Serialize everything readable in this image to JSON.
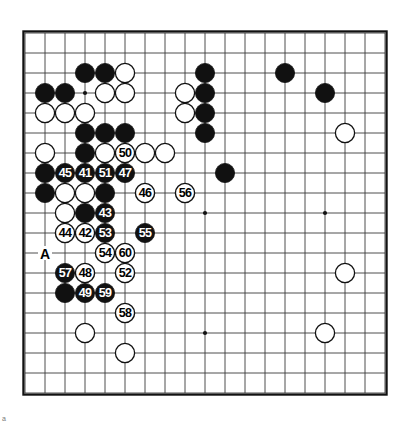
{
  "diagram": {
    "kind": "go-board-diagram",
    "size": 19,
    "origin_x": 25,
    "origin_y": 33,
    "spacing": 20,
    "stone_radius": 9.6,
    "colors": {
      "line": "#3a3a3a",
      "border": "#111111",
      "black_stone": "#111111",
      "white_stone": "#ffffff",
      "background": "#ffffff"
    },
    "star_points": [
      {
        "c": 3,
        "r": 3
      },
      {
        "c": 9,
        "r": 3
      },
      {
        "c": 15,
        "r": 3
      },
      {
        "c": 3,
        "r": 9
      },
      {
        "c": 9,
        "r": 9
      },
      {
        "c": 15,
        "r": 9
      },
      {
        "c": 3,
        "r": 15
      },
      {
        "c": 9,
        "r": 15
      },
      {
        "c": 15,
        "r": 15
      }
    ],
    "plain_stones": [
      {
        "c": 3,
        "r": 2,
        "color": "black"
      },
      {
        "c": 4,
        "r": 2,
        "color": "black"
      },
      {
        "c": 5,
        "r": 2,
        "color": "white"
      },
      {
        "c": 9,
        "r": 2,
        "color": "black"
      },
      {
        "c": 13,
        "r": 2,
        "color": "black"
      },
      {
        "c": 1,
        "r": 3,
        "color": "black"
      },
      {
        "c": 2,
        "r": 3,
        "color": "black"
      },
      {
        "c": 4,
        "r": 3,
        "color": "white"
      },
      {
        "c": 5,
        "r": 3,
        "color": "white"
      },
      {
        "c": 8,
        "r": 3,
        "color": "white"
      },
      {
        "c": 9,
        "r": 3,
        "color": "black"
      },
      {
        "c": 15,
        "r": 3,
        "color": "black"
      },
      {
        "c": 1,
        "r": 4,
        "color": "white"
      },
      {
        "c": 2,
        "r": 4,
        "color": "white"
      },
      {
        "c": 3,
        "r": 4,
        "color": "white"
      },
      {
        "c": 8,
        "r": 4,
        "color": "white"
      },
      {
        "c": 9,
        "r": 4,
        "color": "black"
      },
      {
        "c": 3,
        "r": 5,
        "color": "black"
      },
      {
        "c": 4,
        "r": 5,
        "color": "black"
      },
      {
        "c": 5,
        "r": 5,
        "color": "black"
      },
      {
        "c": 9,
        "r": 5,
        "color": "black"
      },
      {
        "c": 16,
        "r": 5,
        "color": "white"
      },
      {
        "c": 1,
        "r": 6,
        "color": "white"
      },
      {
        "c": 3,
        "r": 6,
        "color": "black"
      },
      {
        "c": 4,
        "r": 6,
        "color": "white"
      },
      {
        "c": 6,
        "r": 6,
        "color": "white"
      },
      {
        "c": 7,
        "r": 6,
        "color": "white"
      },
      {
        "c": 1,
        "r": 7,
        "color": "black"
      },
      {
        "c": 10,
        "r": 7,
        "color": "black"
      },
      {
        "c": 1,
        "r": 8,
        "color": "black"
      },
      {
        "c": 2,
        "r": 8,
        "color": "white"
      },
      {
        "c": 3,
        "r": 8,
        "color": "white"
      },
      {
        "c": 4,
        "r": 8,
        "color": "black"
      },
      {
        "c": 2,
        "r": 9,
        "color": "white"
      },
      {
        "c": 3,
        "r": 9,
        "color": "black"
      },
      {
        "c": 2,
        "r": 13,
        "color": "black"
      },
      {
        "c": 16,
        "r": 12,
        "color": "white"
      },
      {
        "c": 3,
        "r": 15,
        "color": "white"
      },
      {
        "c": 15,
        "r": 15,
        "color": "white"
      },
      {
        "c": 5,
        "r": 16,
        "color": "white"
      }
    ],
    "numbered_stones": [
      {
        "n": "45",
        "c": 2,
        "r": 7,
        "color": "black"
      },
      {
        "n": "41",
        "c": 3,
        "r": 7,
        "color": "black"
      },
      {
        "n": "51",
        "c": 4,
        "r": 7,
        "color": "black"
      },
      {
        "n": "47",
        "c": 5,
        "r": 7,
        "color": "black"
      },
      {
        "n": "50",
        "c": 5,
        "r": 6,
        "color": "white"
      },
      {
        "n": "46",
        "c": 6,
        "r": 8,
        "color": "white"
      },
      {
        "n": "56",
        "c": 8,
        "r": 8,
        "color": "white"
      },
      {
        "n": "43",
        "c": 4,
        "r": 9,
        "color": "black"
      },
      {
        "n": "44",
        "c": 2,
        "r": 10,
        "color": "white"
      },
      {
        "n": "42",
        "c": 3,
        "r": 10,
        "color": "white"
      },
      {
        "n": "53",
        "c": 4,
        "r": 10,
        "color": "black"
      },
      {
        "n": "55",
        "c": 6,
        "r": 10,
        "color": "black"
      },
      {
        "n": "54",
        "c": 4,
        "r": 11,
        "color": "white"
      },
      {
        "n": "60",
        "c": 5,
        "r": 11,
        "color": "white"
      },
      {
        "n": "57",
        "c": 2,
        "r": 12,
        "color": "black"
      },
      {
        "n": "48",
        "c": 3,
        "r": 12,
        "color": "white"
      },
      {
        "n": "52",
        "c": 5,
        "r": 12,
        "color": "white"
      },
      {
        "n": "49",
        "c": 3,
        "r": 13,
        "color": "black"
      },
      {
        "n": "59",
        "c": 4,
        "r": 13,
        "color": "black"
      },
      {
        "n": "58",
        "c": 5,
        "r": 14,
        "color": "white"
      }
    ],
    "point_labels": [
      {
        "text": "A",
        "c": 1,
        "r": 11
      }
    ],
    "edge_mark": "a"
  },
  "chart_data": {
    "type": "table",
    "board_size": 19,
    "move_sequence": [
      {
        "move": 41,
        "color": "black",
        "column": 3,
        "row": 7
      },
      {
        "move": 42,
        "color": "white",
        "column": 3,
        "row": 10
      },
      {
        "move": 43,
        "color": "black",
        "column": 4,
        "row": 9
      },
      {
        "move": 44,
        "color": "white",
        "column": 2,
        "row": 10
      },
      {
        "move": 45,
        "color": "black",
        "column": 2,
        "row": 7
      },
      {
        "move": 46,
        "color": "white",
        "column": 6,
        "row": 8
      },
      {
        "move": 47,
        "color": "black",
        "column": 5,
        "row": 7
      },
      {
        "move": 48,
        "color": "white",
        "column": 3,
        "row": 12
      },
      {
        "move": 49,
        "color": "black",
        "column": 3,
        "row": 13
      },
      {
        "move": 50,
        "color": "white",
        "column": 5,
        "row": 6
      },
      {
        "move": 51,
        "color": "black",
        "column": 4,
        "row": 7
      },
      {
        "move": 52,
        "color": "white",
        "column": 5,
        "row": 12
      },
      {
        "move": 53,
        "color": "black",
        "column": 4,
        "row": 10
      },
      {
        "move": 54,
        "color": "white",
        "column": 4,
        "row": 11
      },
      {
        "move": 55,
        "color": "black",
        "column": 6,
        "row": 10
      },
      {
        "move": 56,
        "color": "white",
        "column": 8,
        "row": 8
      },
      {
        "move": 57,
        "color": "black",
        "column": 2,
        "row": 12
      },
      {
        "move": 58,
        "color": "white",
        "column": 5,
        "row": 14
      },
      {
        "move": 59,
        "color": "black",
        "column": 4,
        "row": 13
      },
      {
        "move": 60,
        "color": "white",
        "column": 5,
        "row": 11
      }
    ]
  }
}
